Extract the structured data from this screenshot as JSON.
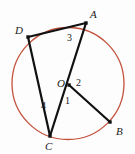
{
  "figure": {
    "type": "circle-geometry-diagram",
    "canvas": {
      "width": 135,
      "height": 154,
      "background": "#fdfdfd"
    },
    "circle": {
      "name": "circle-O",
      "center": {
        "x": 68,
        "y": 83.5
      },
      "radius": 56,
      "stroke": "#c2523c",
      "stroke_width": 1.3
    },
    "points": [
      {
        "id": "A",
        "label": "A",
        "x": 86,
        "y": 23,
        "label_x": 90,
        "label_y": 9,
        "on_circle": true,
        "dot": true
      },
      {
        "id": "D",
        "label": "D",
        "x": 28,
        "y": 37,
        "label_x": 15,
        "label_y": 25,
        "on_circle": true,
        "dot": true
      },
      {
        "id": "O",
        "label": "O",
        "x": 69,
        "y": 85,
        "label_x": 57,
        "label_y": 78,
        "on_circle": false,
        "dot": true
      },
      {
        "id": "B",
        "label": "B",
        "x": 110,
        "y": 122,
        "label_x": 116,
        "label_y": 126,
        "on_circle": true,
        "dot": true
      },
      {
        "id": "C",
        "label": "C",
        "x": 50,
        "y": 136,
        "label_x": 45,
        "label_y": 141,
        "on_circle": true,
        "dot": true
      }
    ],
    "segments": [
      {
        "name": "segment-DA",
        "from": "D",
        "to": "A",
        "stroke": "#111111",
        "stroke_width": 2.2
      },
      {
        "name": "segment-AC",
        "from": "A",
        "to": "C",
        "stroke": "#111111",
        "stroke_width": 2.2
      },
      {
        "name": "segment-DC",
        "from": "D",
        "to": "C",
        "stroke": "#111111",
        "stroke_width": 2.2
      },
      {
        "name": "segment-OB",
        "from": "O",
        "to": "B",
        "stroke": "#111111",
        "stroke_width": 2.2
      }
    ],
    "angle_labels": [
      {
        "id": "3",
        "label": "3",
        "x": 67,
        "y": 33,
        "description": "angle-3-at-A-between-AD-and-AC"
      },
      {
        "id": "2",
        "label": "2",
        "x": 76,
        "y": 78,
        "description": "angle-2-at-O-between-OA-and-OB"
      },
      {
        "id": "1",
        "label": "1",
        "x": 65,
        "y": 96,
        "description": "angle-1-at-O-between-OC-and-OB"
      },
      {
        "id": "4",
        "label": "4",
        "x": 41,
        "y": 101,
        "description": "angle-4-at-C-between-CD-and-CA"
      }
    ],
    "dot": {
      "size": 3.4,
      "fill": "#111111"
    }
  }
}
